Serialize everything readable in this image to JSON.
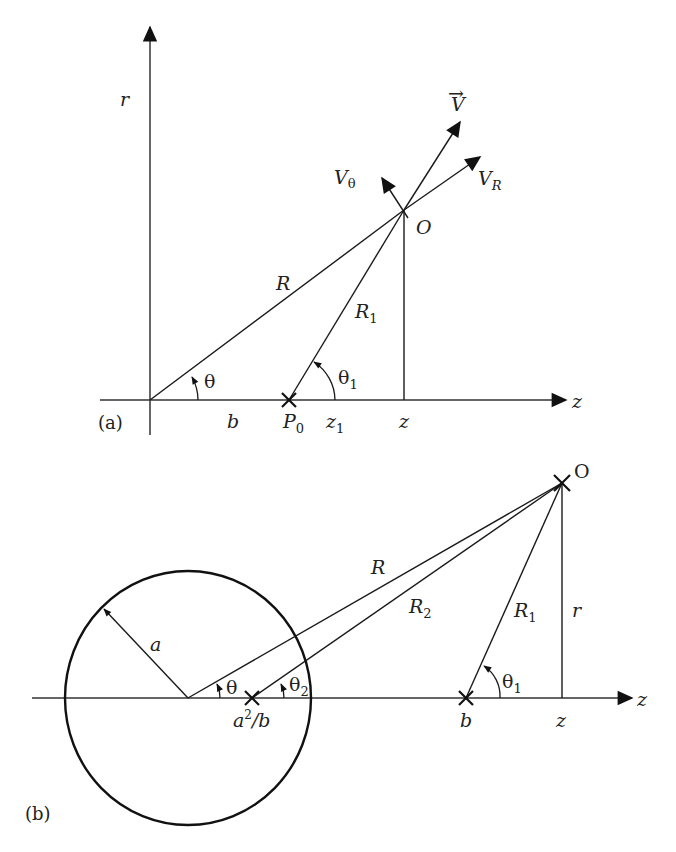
{
  "figure": {
    "panel_a": {
      "caption": "(a)",
      "axis_r_label": "r",
      "axis_z_label": "z",
      "point_O_label": "O",
      "vector_V_label": "V",
      "vector_V_accent": "→",
      "V_theta": {
        "base": "V",
        "sub": "θ"
      },
      "V_R": {
        "base": "V",
        "sub": "R"
      },
      "R_label": "R",
      "R1": {
        "base": "R",
        "sub": "1"
      },
      "theta_label": "θ",
      "theta1": {
        "base": "θ",
        "sub": "1"
      },
      "b_label": "b",
      "P0": {
        "base": "P",
        "sub": "0"
      },
      "z1": {
        "base": "z",
        "sub": "1"
      },
      "z_label": "z"
    },
    "panel_b": {
      "caption": "(b)",
      "point_O_label": "O",
      "axis_z_label": "z",
      "radius_label": "a",
      "R_label": "R",
      "R2": {
        "base": "R",
        "sub": "2"
      },
      "R1": {
        "base": "R",
        "sub": "1"
      },
      "r_label": "r",
      "theta_label": "θ",
      "theta2": {
        "base": "θ",
        "sub": "2"
      },
      "theta1": {
        "base": "θ",
        "sub": "1"
      },
      "image_point": {
        "a": "a",
        "exp": "2",
        "rest": "/b"
      },
      "b_label": "b",
      "z_label": "z"
    },
    "colors": {
      "line": "#1a1a1a",
      "text": "#222222",
      "background": "#ffffff"
    }
  }
}
